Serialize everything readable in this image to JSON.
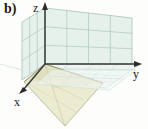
{
  "figure": {
    "panel_label": "b)",
    "caption_type": "3d-axes-diagram",
    "background_color": "#fdfdfc"
  },
  "axes": {
    "z": {
      "label": "z",
      "arrow": "up",
      "tip": [
        45,
        3
      ],
      "origin": [
        45,
        64
      ]
    },
    "y": {
      "label": "y",
      "arrow": "right",
      "tip": [
        141,
        64
      ],
      "origin": [
        45,
        64
      ]
    },
    "x": {
      "label": "x",
      "arrow": "down-left",
      "tip": [
        19,
        93
      ],
      "origin": [
        45,
        64
      ]
    },
    "axis_color": "#3a3a3a"
  },
  "planes": [
    {
      "name": "yz-plane",
      "role": "vertical-back-plane",
      "fill": "#e2efe8",
      "grid_color": "#9dbcae",
      "grid_cols": 4,
      "grid_rows": 3
    },
    {
      "name": "xz-plane",
      "role": "vertical-left-plane",
      "fill": "#e2efe8",
      "grid_color": "#9dbcae",
      "grid_cols": 2,
      "grid_rows": 3
    },
    {
      "name": "xy-plane",
      "role": "horizontal-ground-plane",
      "fill": "#eef5f1",
      "grid_color": "#b9cfc5",
      "grid_cols": 4,
      "grid_rows": 2
    },
    {
      "name": "tilted-plane",
      "role": "olive-triangular-sheet",
      "fill": "#e6e6c8",
      "edge_color": "#8d8d63",
      "grid_color": "#b5b58c"
    }
  ],
  "colors": {
    "mint_fill": "#e2efe8",
    "mint_grid": "#9dbcae",
    "ground_fill": "#eef5f1",
    "ground_grid": "#b9cfc5",
    "olive_fill": "#e6e6c8",
    "olive_edge": "#8d8d63",
    "axis": "#3a3a3a",
    "text": "#1a1a1a"
  }
}
